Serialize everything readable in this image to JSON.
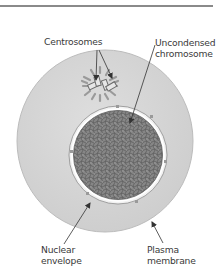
{
  "figure": {
    "type": "cell diagram"
  },
  "labels": {
    "centrosomes": "Centrosomes",
    "chromosome_line1": "Uncondensed",
    "chromosome_line2": "chromosome",
    "nuclear_line1": "Nuclear",
    "nuclear_line2": "envelope",
    "plasma_line1": "Plasma",
    "plasma_line2": "membrane"
  },
  "colors": {
    "cytoplasm": "#d4d4d4",
    "nucleus": "#7b7b7b",
    "text": "#3a3a3a",
    "arrow": "#333333",
    "rule": "#8a8a8a"
  }
}
